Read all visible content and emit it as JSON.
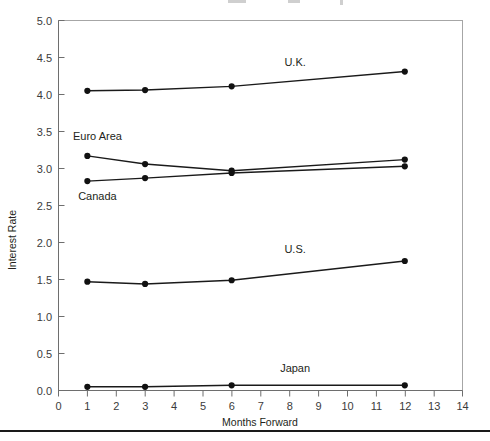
{
  "chart_data": {
    "type": "line",
    "title": "",
    "xlabel": "Months Forward",
    "ylabel": "Interest Rate",
    "x": [
      1,
      3,
      6,
      12
    ],
    "xlim": [
      0,
      14
    ],
    "ylim": [
      0,
      5
    ],
    "xticks": [
      0,
      1,
      2,
      3,
      4,
      5,
      6,
      7,
      8,
      9,
      10,
      11,
      12,
      13,
      14
    ],
    "xtick_labels": [
      "0",
      "1",
      "2",
      "3",
      "4",
      "5",
      "6",
      "7",
      "8",
      "9",
      "10",
      "11",
      "12",
      "13",
      "14"
    ],
    "yticks": [
      0.0,
      0.5,
      1.0,
      1.5,
      2.0,
      2.5,
      3.0,
      3.5,
      4.0,
      4.5,
      5.0
    ],
    "ytick_labels": [
      "0.0",
      "0.5",
      "1.0",
      "1.5",
      "2.0",
      "2.5",
      "3.0",
      "3.5",
      "4.0",
      "4.5",
      "5.0"
    ],
    "grid": false,
    "legend": "inline-labels",
    "marker": "filled-circle",
    "line_color": "#1a1a1a",
    "series": [
      {
        "name": "U.K.",
        "values": [
          4.05,
          4.06,
          4.11,
          4.31
        ],
        "label_x": 8.2,
        "label_y": 4.38
      },
      {
        "name": "Euro Area",
        "values": [
          3.17,
          3.06,
          2.97,
          3.12
        ],
        "label_x": 1.35,
        "label_y": 3.38
      },
      {
        "name": "Canada",
        "values": [
          2.83,
          2.87,
          2.94,
          3.03
        ],
        "label_x": 1.35,
        "label_y": 2.58
      },
      {
        "name": "U.S.",
        "values": [
          1.47,
          1.44,
          1.49,
          1.75
        ],
        "label_x": 8.2,
        "label_y": 1.86
      },
      {
        "name": "Japan",
        "values": [
          0.05,
          0.05,
          0.07,
          0.07
        ],
        "label_x": 8.2,
        "label_y": 0.25
      }
    ]
  },
  "figure": {
    "axis_titles": {
      "x": "Months Forward",
      "y": "Interest Rate"
    }
  }
}
